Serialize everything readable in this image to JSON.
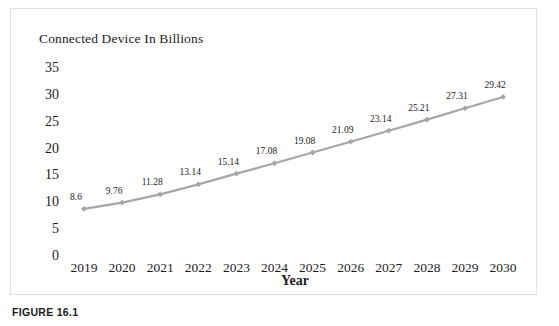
{
  "figure": {
    "caption": "FIGURE 16.1"
  },
  "chart_data": {
    "type": "line",
    "title": "Connected Device In Billions",
    "xlabel": "Year",
    "ylabel": "",
    "categories": [
      "2019",
      "2020",
      "2021",
      "2022",
      "2023",
      "2024",
      "2025",
      "2026",
      "2027",
      "2028",
      "2029",
      "2030"
    ],
    "values": [
      8.6,
      9.76,
      11.28,
      13.14,
      15.14,
      17.08,
      19.08,
      21.09,
      23.14,
      25.21,
      27.31,
      29.42
    ],
    "point_labels": [
      "8.6",
      "9.76",
      "11.28",
      "13.14",
      "15.14",
      "17.08",
      "19.08",
      "21.09",
      "23.14",
      "25.21",
      "27.31",
      "29.42"
    ],
    "ylim": [
      0,
      35
    ],
    "yticks": [
      0,
      5,
      10,
      15,
      20,
      25,
      30,
      35
    ],
    "ytick_labels": [
      "0",
      "5",
      "10",
      "15",
      "20",
      "25",
      "30",
      "35"
    ],
    "grid": false,
    "legend": false,
    "series_color": "#a6a6a6",
    "marker": "diamond",
    "text_color": "#1c1c1c"
  }
}
